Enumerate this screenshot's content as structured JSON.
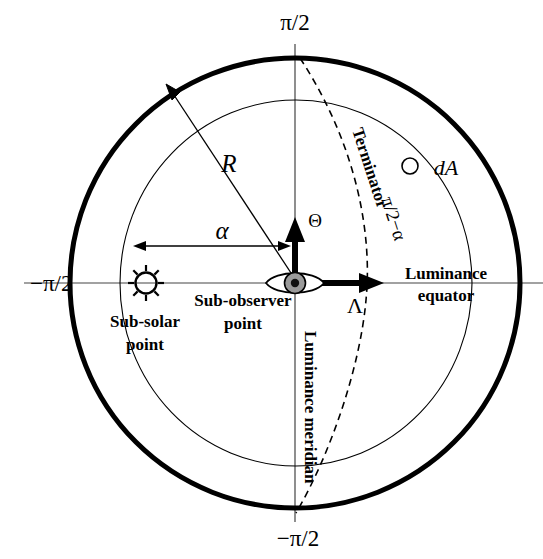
{
  "figure": {
    "type": "geometry-diagram",
    "background_color": "#ffffff",
    "stroke_color": "#000000"
  },
  "axis_labels": {
    "top": "π/2",
    "bottom": "−π/2",
    "left": "−π/2"
  },
  "symbols": {
    "radius": "R",
    "phase_angle": "α",
    "latitude_axis": "Θ",
    "longitude_axis": "Λ",
    "surface_element": "dA"
  },
  "annotations": {
    "terminator": "Terminator",
    "terminator_angle": "π/2−α",
    "luminance_equator_line1": "Luminance",
    "luminance_equator_line2": "equator",
    "luminance_meridian": "Luminance meridian",
    "sub_solar_line1": "Sub-solar",
    "sub_solar_line2": "point",
    "sub_observer_line1": "Sub-observer",
    "sub_observer_line2": "point"
  },
  "icons": {
    "sun": "sun-icon",
    "eye": "eye-icon",
    "surface_element_marker": "dA-circle-marker"
  },
  "geometry": {
    "center": {
      "x": 295,
      "y": 283
    },
    "outer_circle_radius": 225,
    "outer_circle_stroke_width": 5,
    "inner_ellipse_rx": 176,
    "inner_ellipse_ry": 183,
    "inner_ellipse_stroke_width": 1.1,
    "sun_position": {
      "x": 146,
      "y": 283
    },
    "dA_marker": {
      "x": 410,
      "y": 166,
      "r": 8
    },
    "alpha_arrow": {
      "x_start": 286,
      "y": 246,
      "x_end": 138
    },
    "radius_arrow": {
      "x_end": 168,
      "y_end": 88
    },
    "theta_arrow_tip": {
      "x": 295,
      "y": 222
    },
    "lambda_arrow_tip": {
      "x": 381,
      "y": 283
    },
    "terminator_dash_pattern": "7,5"
  }
}
